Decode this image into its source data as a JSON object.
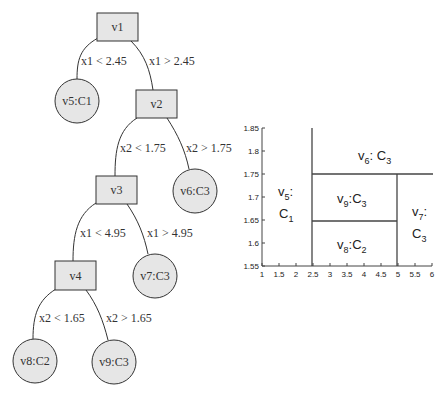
{
  "tree": {
    "nodes": [
      {
        "id": "v1",
        "label": "v1",
        "shape": "box",
        "x": 117,
        "y": 27
      },
      {
        "id": "v2",
        "label": "v2",
        "shape": "box",
        "x": 156,
        "y": 104
      },
      {
        "id": "v3",
        "label": "v3",
        "shape": "box",
        "x": 116,
        "y": 190
      },
      {
        "id": "v4",
        "label": "v4",
        "shape": "box",
        "x": 75,
        "y": 275
      },
      {
        "id": "v5",
        "label": "v5:C1",
        "shape": "circle",
        "x": 77,
        "y": 101
      },
      {
        "id": "v6",
        "label": "v6:C3",
        "shape": "circle",
        "x": 195,
        "y": 191
      },
      {
        "id": "v7",
        "label": "v7:C3",
        "shape": "circle",
        "x": 155,
        "y": 276
      },
      {
        "id": "v8",
        "label": "v8:C2",
        "shape": "circle",
        "x": 35,
        "y": 361
      },
      {
        "id": "v9",
        "label": "v9:C3",
        "shape": "circle",
        "x": 114,
        "y": 362
      }
    ],
    "edges": [
      {
        "from": "v1",
        "to": "v5",
        "label": "x1 < 2.45"
      },
      {
        "from": "v1",
        "to": "v2",
        "label": "x1 > 2.45"
      },
      {
        "from": "v2",
        "to": "v3",
        "label": "x2 < 1.75"
      },
      {
        "from": "v2",
        "to": "v6",
        "label": "x2 > 1.75"
      },
      {
        "from": "v3",
        "to": "v4",
        "label": "x1 < 4.95"
      },
      {
        "from": "v3",
        "to": "v7",
        "label": "x1 > 4.95"
      },
      {
        "from": "v4",
        "to": "v8",
        "label": "x2 < 1.65"
      },
      {
        "from": "v4",
        "to": "v9",
        "label": "x2 > 1.65"
      }
    ]
  },
  "partition_plot": {
    "x_ticks": [
      "1",
      "1.5",
      "2",
      "2.5",
      "3",
      "3.5",
      "4",
      "4.5",
      "5",
      "5.5",
      "6"
    ],
    "y_ticks": [
      "1.55",
      "1.6",
      "1.65",
      "1.7",
      "1.75",
      "1.8",
      "1.85"
    ],
    "xlim": [
      1,
      6
    ],
    "ylim": [
      1.55,
      1.85
    ],
    "splits": [
      {
        "type": "vertical",
        "x": 2.45,
        "y_from": 1.55,
        "y_to": 1.85
      },
      {
        "type": "horizontal",
        "y": 1.75,
        "x_from": 2.45,
        "x_to": 6
      },
      {
        "type": "vertical",
        "x": 4.95,
        "y_from": 1.55,
        "y_to": 1.75
      },
      {
        "type": "horizontal",
        "y": 1.65,
        "x_from": 2.45,
        "x_to": 4.95
      }
    ],
    "regions": {
      "v5": {
        "node": "v",
        "node_sub": "5",
        "sep": ":",
        "cls": "C",
        "cls_sub": "1"
      },
      "v6": {
        "node": "v",
        "node_sub": "6",
        "sep": ": ",
        "cls": "C",
        "cls_sub": "3"
      },
      "v9": {
        "node": "v",
        "node_sub": "9",
        "sep": ":",
        "cls": "C",
        "cls_sub": "3"
      },
      "v8": {
        "node": "v",
        "node_sub": "8",
        "sep": ":",
        "cls": "C",
        "cls_sub": "2"
      },
      "v7": {
        "node": "v",
        "node_sub": "7",
        "sep": ":",
        "cls": "C",
        "cls_sub": "3"
      }
    }
  },
  "colors": {
    "node_fill": "#e6e6e6",
    "stroke": "#333333",
    "background": "#ffffff"
  }
}
